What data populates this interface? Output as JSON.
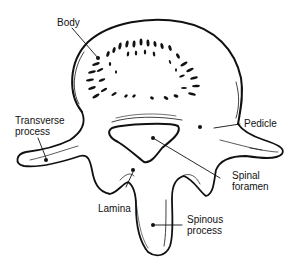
{
  "diagram": {
    "colors": {
      "ink": "#111111",
      "background": "#ffffff"
    },
    "labels": {
      "body": "Body",
      "transverse_line1": "Transverse",
      "transverse_line2": "process",
      "pedicle": "Pedicle",
      "spinal_line1": "Spinal",
      "spinal_line2": "foramen",
      "lamina": "Lamina",
      "spinous_line1": "Spinous",
      "spinous_line2": "process"
    }
  }
}
